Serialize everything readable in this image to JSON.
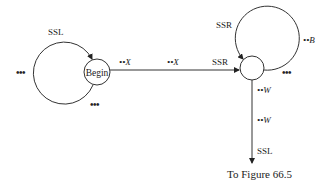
{
  "diagram": {
    "begin_node": {
      "label": "Begin"
    },
    "left_loop": {
      "label": "SSL",
      "left_ellipsis": "•••",
      "bottom_ellipsis": "•••"
    },
    "main_edge": {
      "label_start": "••X",
      "label_mid": "••X",
      "label_end": "SSR"
    },
    "right_loop": {
      "label": "SSR",
      "side_label": "••B",
      "bottom_ellipsis": "•••"
    },
    "down_edge": {
      "label_top": "••W",
      "label_mid": "••W",
      "label_bottom": "SSL",
      "target": "To Figure 66.5"
    }
  }
}
